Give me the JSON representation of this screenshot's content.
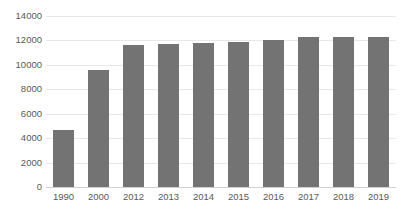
{
  "chart_data": {
    "type": "bar",
    "title": "",
    "subtitle": "",
    "xlabel": "",
    "ylabel": "",
    "categories": [
      "1990",
      "2000",
      "2012",
      "2013",
      "2014",
      "2015",
      "2016",
      "2017",
      "2018",
      "2019"
    ],
    "values": [
      4700,
      9600,
      11650,
      11700,
      11750,
      11850,
      12000,
      12250,
      12300,
      12300
    ],
    "series": [
      {
        "name": "Value",
        "values": [
          4700,
          9600,
          11650,
          11700,
          11750,
          11850,
          12000,
          12250,
          12300,
          12300
        ]
      }
    ],
    "ylim": [
      0,
      14000
    ],
    "ytick_step": 2000,
    "ytick_labels": [
      "0",
      "2000",
      "4000",
      "6000",
      "8000",
      "10000",
      "12000",
      "14000"
    ],
    "ytick_values": [
      0,
      2000,
      4000,
      6000,
      8000,
      10000,
      12000,
      14000
    ],
    "grid": true,
    "grid_orientation": "horizontal",
    "legend": false,
    "legend_position": "none",
    "bar_color": "#737373",
    "background_color": "#ffffff",
    "gridline_color": "#e8e8e8",
    "axis_label_color": "#595959"
  }
}
